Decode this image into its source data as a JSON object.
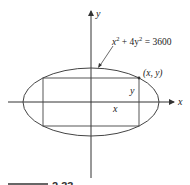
{
  "diagram": {
    "equation_label": {
      "x_part": "x",
      "exp1": "2",
      "mid": " + 4y",
      "exp2": "2",
      "rhs": " = 3600"
    },
    "point_label": "(x, y)",
    "axis_labels": {
      "x": "x",
      "y": "y"
    },
    "dimension_labels": {
      "half_width": "x",
      "half_height": "y"
    },
    "caption_fragment": "2.33",
    "colors": {
      "stroke": "#333333",
      "background": "#ffffff"
    }
  }
}
